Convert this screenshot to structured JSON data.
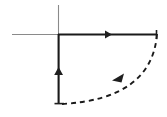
{
  "figure": {
    "width": 167,
    "height": 117,
    "background_color": "#ffffff",
    "stroke_color": "#1a1a1a",
    "axis_color": "#6b6b6b"
  },
  "chart_data": {
    "type": "diagram",
    "title": "",
    "xlabel": "",
    "ylabel": "",
    "grid": false,
    "legend": false,
    "axes": {
      "origin": [
        58,
        34
      ],
      "horizontal_axis": {
        "name": "real-axis",
        "x_start": 12,
        "x_end": 58,
        "y": 34,
        "style": "thin",
        "color": "#8a8a8a"
      },
      "vertical_axis": {
        "name": "imaginary-axis",
        "x": 58,
        "y_start": 5,
        "y_end": 34,
        "style": "thin",
        "color": "#8a8a8a"
      }
    },
    "paths": [
      {
        "name": "top-horizontal-segment",
        "style": "solid",
        "from": [
          58,
          34
        ],
        "to": [
          157,
          34
        ],
        "direction": "rightward",
        "arrow_at": [
          108,
          34
        ],
        "arrow_angle_deg": 0
      },
      {
        "name": "left-vertical-segment",
        "style": "solid",
        "from": [
          58,
          104
        ],
        "to": [
          58,
          34
        ],
        "direction": "upward",
        "arrow_at": [
          58,
          72
        ],
        "arrow_angle_deg": 270
      },
      {
        "name": "dashed-arc",
        "style": "dashed",
        "from": [
          157,
          34
        ],
        "to": [
          62,
          104
        ],
        "direction": "clockwise-inward",
        "arrow_at": [
          120,
          77
        ],
        "arrow_angle_deg": 208,
        "dash_pattern": "5 4",
        "control_point": [
          96,
          99
        ]
      }
    ],
    "markers": [
      {
        "name": "right-end-tick",
        "x": 157,
        "y": 34,
        "kind": "segment-endpoint"
      },
      {
        "name": "bottom-end-tick",
        "x": 58,
        "y": 104,
        "kind": "segment-endpoint"
      }
    ]
  }
}
